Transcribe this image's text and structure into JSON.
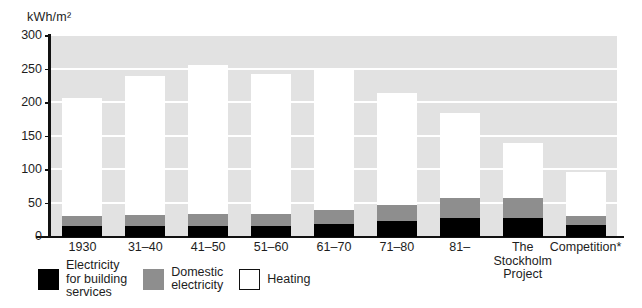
{
  "chart_data": {
    "type": "bar",
    "title": "kWh/m²",
    "xlabel": "",
    "ylabel": "kWh/m²",
    "ylim": [
      0,
      300
    ],
    "yticks": [
      0,
      50,
      100,
      150,
      200,
      250,
      300
    ],
    "grid": true,
    "stacked": true,
    "legend_position": "bottom-left",
    "categories": [
      "1930",
      "31–40",
      "41–50",
      "51–60",
      "61–70",
      "71–80",
      "81–",
      "The\nStockholm\nProject",
      "Competition*"
    ],
    "series": [
      {
        "name": "Electricity for building services",
        "color": "#000000",
        "values": [
          17,
          17,
          17,
          17,
          20,
          24,
          28,
          28,
          18
        ]
      },
      {
        "name": "Domestic electricity",
        "color": "#8e8e8e",
        "values": [
          15,
          16,
          17,
          17,
          21,
          24,
          30,
          30,
          13
        ]
      },
      {
        "name": "Heating",
        "color": "#ffffff",
        "values": [
          175,
          208,
          223,
          209,
          209,
          167,
          127,
          82,
          66
        ]
      }
    ],
    "totals": [
      207,
      241,
      257,
      243,
      250,
      215,
      185,
      140,
      97
    ]
  },
  "axis": {
    "title": "kWh/m²",
    "tick_labels": [
      "300",
      "250",
      "200",
      "150",
      "100",
      "50",
      "0"
    ]
  },
  "legend": {
    "items": [
      {
        "swatch": "black-swatch",
        "label": "Electricity\nfor building\nservices"
      },
      {
        "swatch": "gray-swatch",
        "label": "Domestic\nelectricity"
      },
      {
        "swatch": "white-swatch",
        "label": "Heating"
      }
    ]
  },
  "colors": {
    "plot_background": "#e2e2e2",
    "gridline": "#ffffff",
    "axis": "#111111",
    "electricity_building": "#000000",
    "domestic_electricity": "#8e8e8e",
    "heating": "#ffffff"
  }
}
